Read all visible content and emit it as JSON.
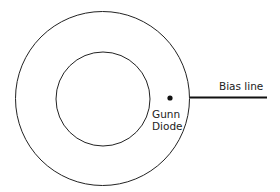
{
  "diagram": {
    "labels": {
      "bias_line": "Bias line",
      "diode_line1": "Gunn",
      "diode_line2": "Diode"
    },
    "colors": {
      "stroke": "#222222",
      "background": "#ffffff"
    }
  }
}
